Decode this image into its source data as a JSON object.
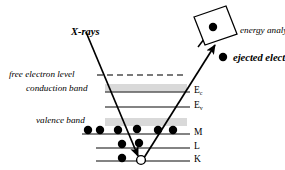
{
  "figure": {
    "background_color": "#ffffff",
    "line_color": "#555555",
    "band_color": "#d9d9d9",
    "ink_color": "#000000",
    "width": 285,
    "height": 170
  },
  "labels": {
    "xrays": "X-rays",
    "energy_analyzer": "energy analyzer",
    "ejected_electron": "ejected electron",
    "free_electron_level": "free electron level",
    "conduction_band": "conduction band",
    "valence_band": "valence band"
  },
  "levels": [
    {
      "id": "free-electron-level",
      "label": "free electron level",
      "side_label": "",
      "style": "dashed",
      "y": 75
    },
    {
      "id": "conduction-band-edge",
      "label": "conduction band",
      "side_label": "E",
      "side_sub": "c",
      "style": "solid",
      "y": 92
    },
    {
      "id": "valence-band-edge",
      "label": "",
      "side_label": "E",
      "side_sub": "v",
      "style": "solid",
      "y": 107
    },
    {
      "id": "shell-m",
      "label": "valence band",
      "side_label": "M",
      "side_sub": "",
      "style": "solid",
      "y": 134
    },
    {
      "id": "shell-l",
      "label": "",
      "side_label": "L",
      "side_sub": "",
      "style": "solid",
      "y": 148
    },
    {
      "id": "shell-k",
      "label": "",
      "side_label": "K",
      "side_sub": "",
      "style": "solid",
      "y": 161
    }
  ],
  "bands": [
    {
      "id": "conduction-band-shading",
      "y": 84,
      "height": 8
    },
    {
      "id": "valence-band-shading",
      "y": 118,
      "height": 8
    }
  ],
  "electrons": {
    "shell_m": [
      {
        "cx": 88,
        "cy": 130
      },
      {
        "cx": 100,
        "cy": 130
      },
      {
        "cx": 118,
        "cy": 130
      },
      {
        "cx": 137,
        "cy": 129
      },
      {
        "cx": 158,
        "cy": 130
      },
      {
        "cx": 173,
        "cy": 130
      }
    ],
    "shell_l": [
      {
        "cx": 122,
        "cy": 144
      },
      {
        "cx": 138,
        "cy": 143
      }
    ],
    "shell_k": [
      {
        "cx": 122,
        "cy": 158
      }
    ],
    "hole": {
      "cx": 141,
      "cy": 160,
      "label": "core hole"
    },
    "ejected": {
      "cx": 223,
      "cy": 57
    },
    "in_analyzer": {
      "cx": 213,
      "cy": 27
    }
  },
  "arrows": {
    "xray": {
      "x1": 86,
      "y1": 32,
      "x2": 139,
      "y2": 157,
      "label": "X-rays"
    },
    "photoelectron": {
      "x1": 141,
      "y1": 160,
      "x2": 214,
      "y2": 45,
      "label": "ejected electron"
    },
    "into_analyzer": {
      "x1": 199,
      "y1": 46,
      "x2": 210,
      "y2": 31
    }
  },
  "analyzer": {
    "name": "energy analyzer",
    "corners": "194,17 226,6 237,34 205,45"
  }
}
